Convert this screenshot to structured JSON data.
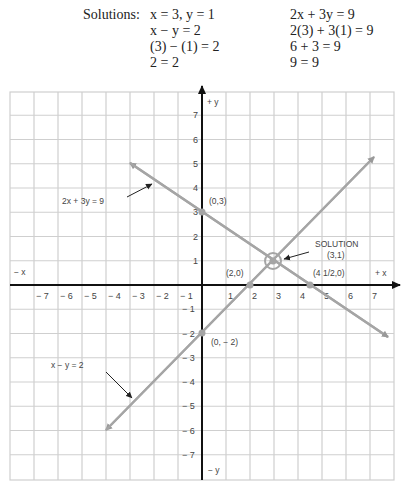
{
  "solutions": {
    "label": "Solutions:",
    "left": [
      "x = 3, y = 1",
      "x − y = 2",
      "(3) − (1) = 2",
      "2 = 2"
    ],
    "right": [
      "2x + 3y = 9",
      "2(3) + 3(1) = 9",
      "6 + 3 = 9",
      "9 = 9"
    ]
  },
  "axes": {
    "pos_x": "+ x",
    "neg_x": "− x",
    "pos_y": "+ y",
    "neg_y": "− y"
  },
  "annotations": {
    "line1_label": "2x + 3y = 9",
    "line2_label": "x − y = 2",
    "p03": "(0,3)",
    "p20": "(2,0)",
    "p0m2": "(0, − 2)",
    "p450": "(4 1/2,0)",
    "solution_title": "SOLUTION",
    "solution_point": "(3,1)"
  },
  "chart_data": {
    "type": "line",
    "title": "",
    "xlabel": "x",
    "ylabel": "y",
    "xlim": [
      -8,
      8
    ],
    "ylim": [
      -8,
      8
    ],
    "grid": true,
    "x_ticks": [
      -7,
      -6,
      -5,
      -4,
      -3,
      -2,
      -1,
      1,
      2,
      3,
      4,
      5,
      6,
      7
    ],
    "y_ticks": [
      7,
      6,
      5,
      4,
      3,
      2,
      1,
      -1,
      -2,
      -3,
      -4,
      -5,
      -6,
      -7
    ],
    "series": [
      {
        "name": "2x + 3y = 9",
        "x": [
          -3,
          7.75
        ],
        "y": [
          5,
          -2.17
        ],
        "intercepts": [
          [
            0,
            3
          ],
          [
            4.5,
            0
          ]
        ]
      },
      {
        "name": "x − y = 2",
        "x": [
          -4,
          7.25
        ],
        "y": [
          -6,
          5.25
        ],
        "intercepts": [
          [
            2,
            0
          ],
          [
            0,
            -2
          ]
        ]
      }
    ],
    "annotations": [
      {
        "text": "SOLUTION (3,1)",
        "x": 3,
        "y": 1
      },
      {
        "text": "(0,3)",
        "x": 0,
        "y": 3
      },
      {
        "text": "(2,0)",
        "x": 2,
        "y": 0
      },
      {
        "text": "(0, −2)",
        "x": 0,
        "y": -2
      },
      {
        "text": "(4 1/2,0)",
        "x": 4.5,
        "y": 0
      }
    ]
  }
}
